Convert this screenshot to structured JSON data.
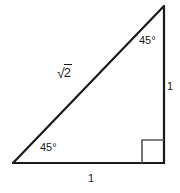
{
  "figure": {
    "background_color": "#ffffff",
    "stroke_color": "#1a1a1a",
    "marker_color": "#555555"
  },
  "labels": {
    "angle_top": "45°",
    "angle_bottom_left": "45°",
    "side_right": "1",
    "side_bottom": "1",
    "hypotenuse_sign": "√",
    "hypotenuse_radicand": "2"
  },
  "geometry": {
    "apex": {
      "x": 164,
      "y": 6
    },
    "bottom_left": {
      "x": 13,
      "y": 163
    },
    "bottom_right": {
      "x": 164,
      "y": 163
    },
    "right_angle_marker": {
      "x": 142,
      "y": 140,
      "size": 23
    }
  }
}
